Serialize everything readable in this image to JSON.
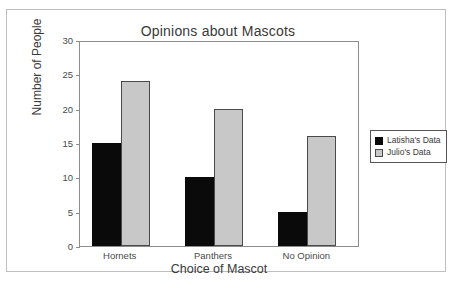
{
  "chart_data": {
    "type": "bar",
    "title": "Opinions about Mascots",
    "xlabel": "Choice of Mascot",
    "ylabel": "Number of People",
    "categories": [
      "Hornets",
      "Panthers",
      "No Opinion"
    ],
    "series": [
      {
        "name": "Latisha's Data",
        "color": "#0a0a0a",
        "values": [
          15,
          10,
          5
        ]
      },
      {
        "name": "Julio's Data",
        "color": "#c8c8c8",
        "values": [
          24,
          20,
          16
        ]
      }
    ],
    "ylim": [
      0,
      30
    ],
    "yticks": [
      0,
      5,
      10,
      15,
      20,
      25,
      30
    ],
    "ytick_labels": [
      "0",
      "5",
      "10",
      "15",
      "20",
      "25",
      "30"
    ],
    "grid": false,
    "legend_position": "right-outside",
    "frame": true
  },
  "colors": {
    "series_0": "#0a0a0a",
    "series_1": "#c8c8c8",
    "axis": "#8c8c8c",
    "outer_border": "#bfbfbf",
    "text": "#3a3a3a",
    "background": "#ffffff"
  }
}
